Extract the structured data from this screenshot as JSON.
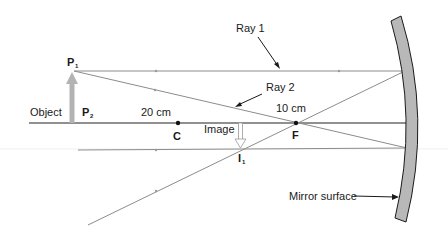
{
  "diagram": {
    "type": "concave-mirror-ray-diagram",
    "labels": {
      "ray1": "Ray 1",
      "ray2": "Ray 2",
      "object": "Object",
      "image": "Image",
      "p1": "P",
      "p1_sub": "1",
      "p2": "P",
      "p2_sub": "2",
      "i1": "I",
      "i1_sub": "1",
      "center": "C",
      "focus": "F",
      "dist_c": "20 cm",
      "dist_f": "10 cm",
      "mirror": "Mirror surface"
    },
    "colors": {
      "ray": "#8c8c8c",
      "axis": "#222222",
      "arrow_fill": "#b3b3b3",
      "mirror_fill": "#b8b8b8",
      "mirror_stroke": "#1a1a1a",
      "text": "#1a1a1a"
    }
  }
}
